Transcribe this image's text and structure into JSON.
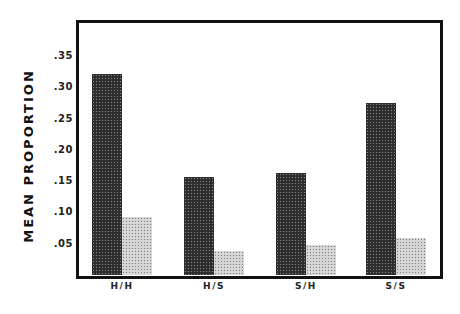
{
  "chart_data": {
    "type": "bar",
    "title": "",
    "xlabel": "",
    "ylabel": "MEAN PROPORTION",
    "categories": [
      "H/H",
      "H/S",
      "S/H",
      "S/S"
    ],
    "series": [
      {
        "name": "dark",
        "color": "#2e2e2e",
        "values": [
          0.323,
          0.158,
          0.165,
          0.276
        ]
      },
      {
        "name": "light",
        "color": "#c4c4c4",
        "values": [
          0.094,
          0.04,
          0.05,
          0.061
        ]
      }
    ],
    "yticks": [
      ".05",
      ".10",
      ".15",
      ".20",
      ".25",
      ".30",
      ".35"
    ],
    "ytick_values": [
      0.05,
      0.1,
      0.15,
      0.2,
      0.25,
      0.3,
      0.35
    ],
    "ylim": [
      0,
      0.4
    ],
    "grid": false,
    "legend": null
  }
}
